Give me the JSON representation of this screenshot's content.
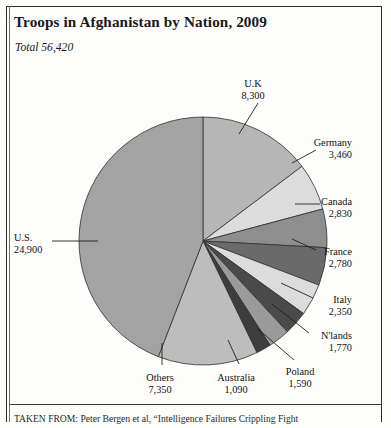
{
  "figure": {
    "title": "Troops in Afghanistan by Nation, 2009",
    "subtitle": "Total 56,420",
    "source": "TAKEN FROM: Peter Bergen et al, “Intelligence Failures Crippling Fight"
  },
  "chart_data": {
    "type": "pie",
    "title": "Troops in Afghanistan by Nation, 2009",
    "subtitle": "Total 56,420",
    "total": 56420,
    "units": "troops",
    "start_angle_deg": 0,
    "direction": "clockwise",
    "legend": "none",
    "labels_style": "leader-line callouts",
    "categories": [
      "U.K",
      "Germany",
      "Canada",
      "France",
      "Italy",
      "N'lands",
      "Poland",
      "Australia",
      "Others",
      "U.S."
    ],
    "values": [
      8300,
      3460,
      2830,
      2780,
      2350,
      1770,
      1590,
      1090,
      7350,
      24900
    ],
    "value_labels": [
      "8,300",
      "3,460",
      "2,830",
      "2,780",
      "2,350",
      "1,770",
      "1,590",
      "1,090",
      "7,350",
      "24,900"
    ],
    "colors": [
      "#b6b6b6",
      "#dcdcdc",
      "#8e8e8e",
      "#6a6a6a",
      "#dcdcdc",
      "#4a4a4a",
      "#9a9a9a",
      "#3d3d3d",
      "#bdbdbd",
      "#a3a3a3"
    ],
    "slices": [
      {
        "name": "U.K",
        "value": 8300,
        "value_label": "8,300",
        "color": "#b6b6b6",
        "label_x": 253,
        "label_y": 78,
        "align": "center",
        "leader": [
          [
            258,
            103
          ],
          [
            239,
            134
          ]
        ]
      },
      {
        "name": "Germany",
        "value": 3460,
        "value_label": "3,460",
        "color": "#dcdcdc",
        "label_x": 352,
        "label_y": 137,
        "align": "right",
        "leader": [
          [
            316,
            150
          ],
          [
            292,
            163
          ]
        ]
      },
      {
        "name": "Canada",
        "value": 2830,
        "value_label": "2,830",
        "color": "#8e8e8e",
        "label_x": 352,
        "label_y": 196,
        "align": "right",
        "leader": [
          [
            320,
            204
          ],
          [
            295,
            204
          ]
        ]
      },
      {
        "name": "France",
        "value": 2780,
        "value_label": "2,780",
        "color": "#6a6a6a",
        "label_x": 352,
        "label_y": 246,
        "align": "right",
        "leader": [
          [
            316,
            250
          ],
          [
            292,
            239
          ]
        ]
      },
      {
        "name": "Italy",
        "value": 2350,
        "value_label": "2,350",
        "color": "#dcdcdc",
        "label_x": 352,
        "label_y": 294,
        "align": "right",
        "leader": [
          [
            313,
            298
          ],
          [
            281,
            283
          ]
        ]
      },
      {
        "name": "N'lands",
        "value": 1770,
        "value_label": "1,770",
        "color": "#4a4a4a",
        "label_x": 352,
        "label_y": 330,
        "align": "right",
        "leader": [
          [
            309,
            333
          ],
          [
            272,
            304
          ]
        ]
      },
      {
        "name": "Poland",
        "value": 1590,
        "value_label": "1,590",
        "color": "#9a9a9a",
        "label_x": 300,
        "label_y": 366,
        "align": "center",
        "leader": [
          [
            294,
            360
          ],
          [
            258,
            329
          ]
        ]
      },
      {
        "name": "Australia",
        "value": 1090,
        "value_label": "1,090",
        "color": "#3d3d3d",
        "label_x": 236,
        "label_y": 372,
        "align": "center",
        "leader": [
          [
            239,
            364
          ],
          [
            228,
            340
          ]
        ]
      },
      {
        "name": "Others",
        "value": 7350,
        "value_label": "7,350",
        "color": "#bdbdbd",
        "label_x": 160,
        "label_y": 372,
        "align": "center",
        "leader": [
          [
            162,
            365
          ],
          [
            162,
            343
          ]
        ]
      },
      {
        "name": "U.S.",
        "value": 24900,
        "value_label": "24,900",
        "color": "#a3a3a3",
        "label_x": 14,
        "label_y": 232,
        "align": "left",
        "leader": [
          [
            52,
            241
          ],
          [
            98,
            241
          ]
        ]
      }
    ]
  }
}
